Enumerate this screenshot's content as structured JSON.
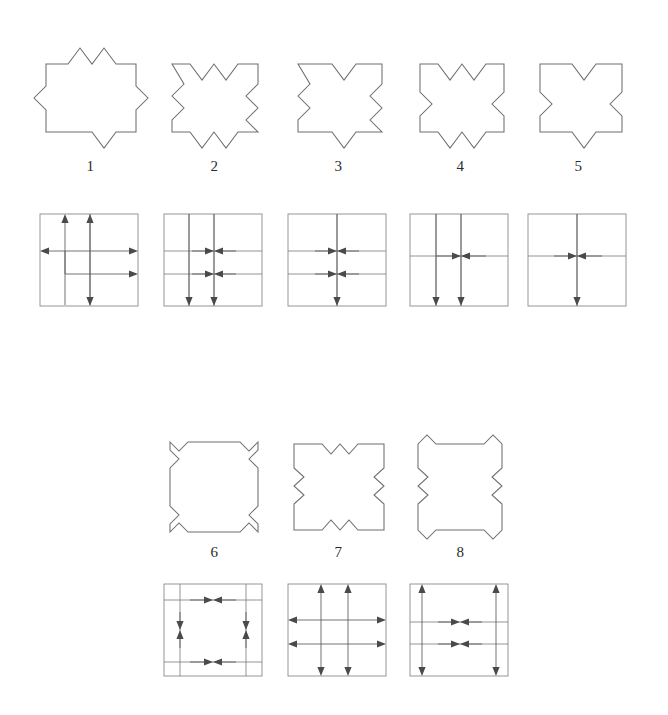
{
  "figure": {
    "type": "technical-line-diagram",
    "background_color": "#ffffff",
    "outline_color": "#6e6e6e",
    "arrow_color": "#4a4a4a",
    "box_color": "#8a8a8a",
    "rows": [
      {
        "row_id": "row-1",
        "shape_labels": [
          "1",
          "2",
          "3",
          "4",
          "5"
        ],
        "shape_count": 5
      },
      {
        "row_id": "row-2",
        "shape_labels": [
          "6",
          "7",
          "8"
        ],
        "shape_count": 3
      }
    ],
    "items": [
      {
        "label": "1",
        "shape_name": "zigzag-square-1",
        "top_edge": "two outward peaks",
        "bottom_edge": "one outward peak",
        "left_edge": "one outward peak",
        "right_edge": "two outward peaks",
        "diagram_name": "arrow-diagram-1",
        "arrows": "two up arrows, one down arrow, one left arrow, two right arrows"
      },
      {
        "label": "2",
        "shape_name": "zigzag-square-2",
        "top_edge": "two inward notches",
        "bottom_edge": "two outward peaks",
        "left_edge": "two zigzags",
        "right_edge": "two zigzags",
        "diagram_name": "arrow-diagram-2",
        "arrows": "two down arrows, two converging horizontal pairs"
      },
      {
        "label": "3",
        "shape_name": "zigzag-square-3",
        "top_edge": "one inward notch",
        "bottom_edge": "one outward peak",
        "left_edge": "two zigzags",
        "right_edge": "two zigzags",
        "diagram_name": "arrow-diagram-3",
        "arrows": "one down arrow, two converging horizontal pairs"
      },
      {
        "label": "4",
        "shape_name": "zigzag-square-4",
        "top_edge": "two inward notches",
        "bottom_edge": "two outward peaks",
        "left_edge": "one notch",
        "right_edge": "one notch",
        "diagram_name": "arrow-diagram-4",
        "arrows": "two down arrows, one converging horizontal pair"
      },
      {
        "label": "5",
        "shape_name": "zigzag-square-5",
        "top_edge": "one inward notch",
        "bottom_edge": "one outward peak",
        "left_edge": "one notch",
        "right_edge": "one notch",
        "diagram_name": "arrow-diagram-5",
        "arrows": "one down arrow, one converging horizontal pair"
      },
      {
        "label": "6",
        "shape_name": "zigzag-square-6",
        "top_edge": "corner notches only",
        "bottom_edge": "corner notches only",
        "left_edge": "corner notches only",
        "right_edge": "corner notches only",
        "diagram_name": "arrow-diagram-6",
        "arrows": "two horizontal converging pairs, two vertical converging pairs"
      },
      {
        "label": "7",
        "shape_name": "zigzag-square-7",
        "top_edge": "two small inward notches",
        "bottom_edge": "two small inward notches",
        "left_edge": "two small inward notches",
        "right_edge": "two small inward notches",
        "diagram_name": "arrow-diagram-7",
        "arrows": "two vertical double arrows, two horizontal double arrows"
      },
      {
        "label": "8",
        "shape_name": "zigzag-square-8",
        "top_edge": "corner notches",
        "bottom_edge": "corner notches",
        "left_edge": "two small inward notches",
        "right_edge": "two small inward notches",
        "diagram_name": "arrow-diagram-8",
        "arrows": "two vertical double arrows at edges, two horizontal converging pairs"
      }
    ]
  }
}
